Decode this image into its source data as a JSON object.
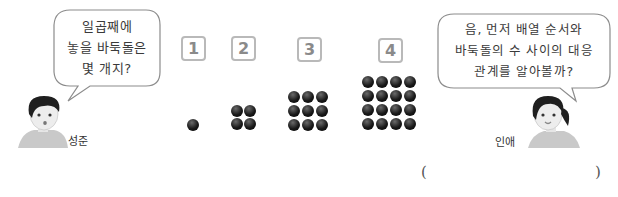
{
  "characters": {
    "left": {
      "name": "성준",
      "speech_lines": [
        "일곱째에",
        "놓을 바둑돌은",
        "몇 개지?"
      ]
    },
    "right": {
      "name": "인애",
      "speech_lines": [
        "음, 먼저 배열 순서와",
        "바둑돌의 수 사이의 대응",
        "관계를 알아볼까?"
      ]
    }
  },
  "sequence": [
    {
      "order": "1",
      "grid": 1
    },
    {
      "order": "2",
      "grid": 2
    },
    {
      "order": "3",
      "grid": 3
    },
    {
      "order": "4",
      "grid": 4
    }
  ],
  "answer": {
    "open_paren": "(",
    "close_paren": ")",
    "value": ""
  },
  "colors": {
    "box_border": "#b9b9b9",
    "box_number": "#8a8a8a",
    "stone": "#111111",
    "bubble_stroke": "#8c8c8c"
  }
}
